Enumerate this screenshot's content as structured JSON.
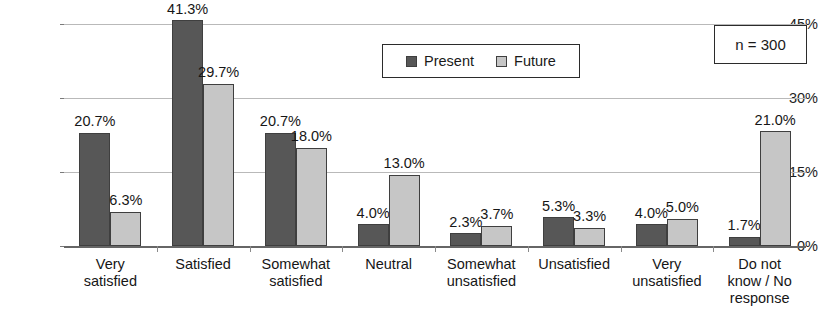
{
  "chart_data": {
    "type": "bar",
    "title": "",
    "xlabel": "",
    "ylabel": "",
    "ylim": [
      0,
      45
    ],
    "yticks": [
      "0%",
      "15%",
      "30%",
      "45%"
    ],
    "ytick_values": [
      0,
      15,
      30,
      45
    ],
    "grid": true,
    "legend_position": "top-center",
    "categories": [
      "Very\nsatisfied",
      "Satisfied",
      "Somewhat\nsatisfied",
      "Neutral",
      "Somewhat\nunsatisfied",
      "Unsatisfied",
      "Very\nunsatisfied",
      "Do not\nknow / No\nresponse"
    ],
    "category_lines": [
      [
        "Very",
        "satisfied"
      ],
      [
        "Satisfied"
      ],
      [
        "Somewhat",
        "satisfied"
      ],
      [
        "Neutral"
      ],
      [
        "Somewhat",
        "unsatisfied"
      ],
      [
        "Unsatisfied"
      ],
      [
        "Very",
        "unsatisfied"
      ],
      [
        "Do not",
        "know / No",
        "response"
      ]
    ],
    "series": [
      {
        "name": "Present",
        "color": "#575757",
        "values": [
          20.7,
          41.3,
          20.7,
          4.0,
          2.3,
          5.3,
          4.0,
          1.7
        ],
        "labels": [
          "20.7%",
          "41.3%",
          "20.7%",
          "4.0%",
          "2.3%",
          "5.3%",
          "4.0%",
          "1.7%"
        ]
      },
      {
        "name": "Future",
        "color": "#c6c6c6",
        "values": [
          6.3,
          29.7,
          18.0,
          13.0,
          3.7,
          3.3,
          5.0,
          21.0
        ],
        "labels": [
          "6.3%",
          "29.7%",
          "18.0%",
          "13.0%",
          "3.7%",
          "3.3%",
          "5.0%",
          "21.0%"
        ]
      }
    ],
    "annotation": "n = 300"
  },
  "legend": {
    "items": [
      {
        "label": "Present",
        "color": "#575757"
      },
      {
        "label": "Future",
        "color": "#c6c6c6"
      }
    ]
  },
  "sample_note": {
    "text": "n = 300"
  },
  "axis": {
    "y_labels": [
      "45%",
      "30%",
      "15%",
      "0%"
    ]
  }
}
